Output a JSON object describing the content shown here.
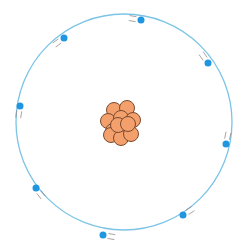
{
  "diagram": {
    "type": "atom-model",
    "orbit": {
      "cx": 124,
      "cy": 122,
      "r": 108,
      "color": "#7cc4e6"
    },
    "nucleus": {
      "fill": "#f4a06c",
      "stroke": "#7a4a30",
      "particles": [
        {
          "x": 114,
          "y": 110
        },
        {
          "x": 127,
          "y": 108
        },
        {
          "x": 108,
          "y": 121
        },
        {
          "x": 121,
          "y": 118
        },
        {
          "x": 133,
          "y": 120
        },
        {
          "x": 113,
          "y": 131
        },
        {
          "x": 126,
          "y": 129
        },
        {
          "x": 111,
          "y": 135
        },
        {
          "x": 121,
          "y": 138
        },
        {
          "x": 131,
          "y": 134
        },
        {
          "x": 118,
          "y": 125
        },
        {
          "x": 128,
          "y": 124
        }
      ],
      "particle_r": 7.5
    },
    "electrons": {
      "color": "#2196e0",
      "r": 3.5,
      "items": [
        {
          "x": 141,
          "y": 20,
          "angle": 0
        },
        {
          "x": 208,
          "y": 63,
          "angle": 60
        },
        {
          "x": 226,
          "y": 144,
          "angle": 100
        },
        {
          "x": 183,
          "y": 215,
          "angle": 150
        },
        {
          "x": 103,
          "y": 235,
          "angle": 190
        },
        {
          "x": 36,
          "y": 188,
          "angle": 230
        },
        {
          "x": 20,
          "y": 106,
          "angle": 270
        },
        {
          "x": 64,
          "y": 38,
          "angle": 315
        }
      ]
    },
    "motion_lines_color": "#9a8a8a"
  }
}
